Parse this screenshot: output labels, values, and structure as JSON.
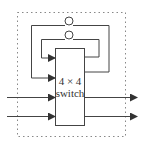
{
  "diagram": {
    "switch": {
      "line1": "4 × 4",
      "line2": "switch"
    },
    "colors": {
      "stroke": "#444444",
      "dashed": "#888888",
      "background": "#ffffff"
    },
    "elements": {
      "delay_loops": 2,
      "inputs": 2,
      "outputs": 2
    }
  }
}
